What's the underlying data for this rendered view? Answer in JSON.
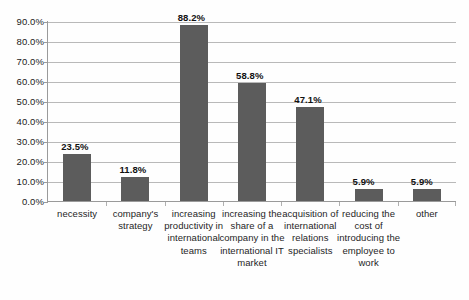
{
  "chart_data": {
    "type": "bar",
    "title": "",
    "subtitle": "",
    "xlabel": "",
    "ylabel": "",
    "ylim": [
      0,
      90
    ],
    "grid": true,
    "legend": false,
    "legend_position": "none",
    "orientation": "vertical",
    "bar_color": "#5c5c5c",
    "categories": [
      "necessity",
      "company's strategy",
      "increasing productivity in international teams",
      "increasing the share of a company in the international IT market",
      "acquisition of international relations specialists",
      "reducing the cost of introducing the employee to work",
      "other"
    ],
    "values": [
      23.5,
      11.8,
      88.2,
      58.8,
      47.1,
      5.9,
      5.9
    ],
    "data_labels": [
      "23.5%",
      "11.8%",
      "88.2%",
      "58.8%",
      "47.1%",
      "5.9%",
      "5.9%"
    ],
    "y_tick_labels": [
      "90.0%",
      "80.0%",
      "70.0%",
      "60.0%",
      "50.0%",
      "40.0%",
      "30.0%",
      "20.0%",
      "10.0%",
      "0.0%"
    ],
    "y_tick_values": [
      90,
      80,
      70,
      60,
      50,
      40,
      30,
      20,
      10,
      0
    ],
    "annotations": []
  }
}
